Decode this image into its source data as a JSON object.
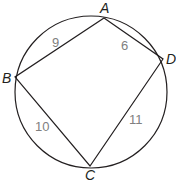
{
  "diagram": {
    "type": "cyclic-quadrilateral-inscribed-in-circle",
    "circle": {
      "cx": 91,
      "cy": 92,
      "r": 76
    },
    "vertices": {
      "A": {
        "label": "A",
        "x": 104,
        "y": 18,
        "lx": 100,
        "ly": 13
      },
      "B": {
        "label": "B",
        "x": 15,
        "y": 77,
        "lx": 2,
        "ly": 83
      },
      "C": {
        "label": "C",
        "x": 90,
        "y": 166,
        "lx": 85,
        "ly": 180
      },
      "D": {
        "label": "D",
        "x": 163,
        "y": 59,
        "lx": 166,
        "ly": 64
      }
    },
    "sides": [
      {
        "from": "A",
        "to": "B",
        "length": "9",
        "lx": 52,
        "ly": 47
      },
      {
        "from": "A",
        "to": "D",
        "length": "6",
        "lx": 121,
        "ly": 50
      },
      {
        "from": "B",
        "to": "C",
        "length": "10",
        "lx": 35,
        "ly": 131
      },
      {
        "from": "D",
        "to": "C",
        "length": "11",
        "lx": 129,
        "ly": 124
      }
    ],
    "colors": {
      "stroke": "#231f20",
      "side_label": "#808080",
      "vertex_label": "#231f20"
    }
  }
}
